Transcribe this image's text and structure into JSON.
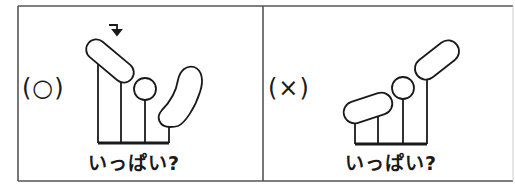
{
  "panels": [
    {
      "id": "correct",
      "label": "(○)",
      "verdict": "correct",
      "caption": "いっぱい?",
      "has_arrow": true,
      "arrow_glyph": "↴"
    },
    {
      "id": "incorrect",
      "label": "(×)",
      "verdict": "incorrect",
      "caption": "いっぱい?",
      "has_arrow": false
    }
  ],
  "colors": {
    "stroke": "#1a1a1a",
    "border": "#555555",
    "background": "#ffffff"
  }
}
